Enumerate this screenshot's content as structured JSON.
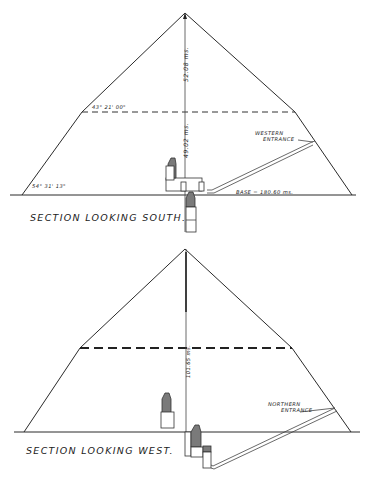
{
  "sections": [
    {
      "id": "south",
      "caption": "SECTION LOOKING SOUTH.",
      "labels": {
        "total_height": "52.08 ms.",
        "lower_height": "49.02 ms.",
        "upper_angle": "43° 21' 00\"",
        "lower_angle": "54° 31' 13\"",
        "base": "BASE = 180.60 ms.",
        "entrance_line1": "WESTERN",
        "entrance_line2": "ENTRANCE"
      }
    },
    {
      "id": "west",
      "caption": "SECTION LOOKING WEST.",
      "labels": {
        "height": "101.65 ms.",
        "entrance_line1": "NORTHERN",
        "entrance_line2": "ENTRANCE"
      }
    }
  ]
}
